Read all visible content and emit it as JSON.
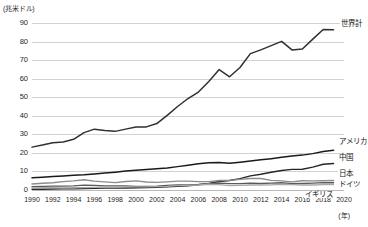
{
  "chart_data": {
    "type": "line",
    "title": "",
    "subtitle": "",
    "xlabel": "(年)",
    "ylabel": "(兆米ドル)",
    "unit_note": "(兆米ドル)",
    "year_note": "(年)",
    "xlim": [
      1990,
      2020
    ],
    "ylim": [
      0,
      90
    ],
    "ytick_step": 10,
    "xtick_step": 2,
    "grid": true,
    "legend_position": "right-inline",
    "x": [
      1990,
      1991,
      1992,
      1993,
      1994,
      1995,
      1996,
      1997,
      1998,
      1999,
      2000,
      2001,
      2002,
      2003,
      2004,
      2005,
      2006,
      2007,
      2008,
      2009,
      2010,
      2011,
      2012,
      2013,
      2014,
      2015,
      2016,
      2017,
      2018,
      2019
    ],
    "yticks": [
      0,
      10,
      20,
      30,
      40,
      50,
      60,
      70,
      80,
      90
    ],
    "xticks": [
      1990,
      1992,
      1994,
      1996,
      1998,
      2000,
      2002,
      2004,
      2006,
      2008,
      2010,
      2012,
      2014,
      2016,
      2018,
      2020
    ],
    "series": [
      {
        "name": "世界計",
        "label": "世界計",
        "color": "#303030",
        "values": [
          23.1,
          24.3,
          25.5,
          25.9,
          27.3,
          30.9,
          32.8,
          32.1,
          31.6,
          32.8,
          33.9,
          34.0,
          35.8,
          40.2,
          45.0,
          49.3,
          52.8,
          58.5,
          64.9,
          61.0,
          66.0,
          73.5,
          75.5,
          77.8,
          80.1,
          75.5,
          76.0,
          81.3,
          86.5,
          86.4
        ]
      },
      {
        "name": "アメリカ",
        "label": "アメリカ",
        "color": "#1a1a1a",
        "values": [
          6.6,
          6.9,
          7.3,
          7.6,
          8.0,
          8.2,
          8.6,
          9.1,
          9.6,
          10.2,
          10.7,
          11.0,
          11.4,
          11.9,
          12.6,
          13.4,
          14.2,
          14.7,
          14.8,
          14.4,
          15.0,
          15.6,
          16.3,
          16.9,
          17.6,
          18.3,
          18.8,
          19.6,
          20.7,
          21.4
        ]
      },
      {
        "name": "中国",
        "label": "中国",
        "color": "#262626",
        "values": [
          0.4,
          0.4,
          0.5,
          0.6,
          0.6,
          0.8,
          0.9,
          1.0,
          1.0,
          1.1,
          1.2,
          1.3,
          1.5,
          1.7,
          2.0,
          2.3,
          2.8,
          3.6,
          4.6,
          5.1,
          6.1,
          7.6,
          8.5,
          9.6,
          10.5,
          11.1,
          11.2,
          12.3,
          13.9,
          14.3
        ]
      },
      {
        "name": "日本",
        "label": "日本",
        "color": "#8c8c8c",
        "values": [
          3.2,
          3.6,
          3.9,
          4.5,
          4.9,
          5.5,
          4.8,
          4.4,
          4.0,
          4.6,
          4.9,
          4.3,
          4.1,
          4.4,
          4.8,
          4.8,
          4.5,
          4.5,
          5.1,
          5.2,
          5.7,
          6.2,
          6.2,
          5.2,
          4.9,
          4.4,
          5.0,
          4.9,
          5.0,
          5.1
        ]
      },
      {
        "name": "ドイツ",
        "label": "ドイツ",
        "color": "#5a5a5a",
        "values": [
          1.8,
          1.9,
          2.1,
          2.1,
          2.2,
          2.6,
          2.5,
          2.2,
          2.2,
          2.2,
          1.9,
          1.9,
          2.1,
          2.5,
          2.8,
          2.8,
          3.0,
          3.4,
          3.7,
          3.4,
          3.4,
          3.7,
          3.5,
          3.7,
          3.9,
          3.4,
          3.5,
          3.7,
          4.0,
          3.9
        ]
      },
      {
        "name": "イギリス",
        "label": "イギリス",
        "color": "#a8a8a8",
        "values": [
          1.1,
          1.2,
          1.2,
          1.1,
          1.2,
          1.3,
          1.4,
          1.6,
          1.6,
          1.7,
          1.7,
          1.7,
          1.8,
          2.0,
          2.4,
          2.5,
          2.7,
          3.1,
          2.9,
          2.4,
          2.5,
          2.7,
          2.7,
          2.8,
          3.1,
          2.9,
          2.7,
          2.7,
          2.9,
          2.9
        ]
      }
    ]
  }
}
